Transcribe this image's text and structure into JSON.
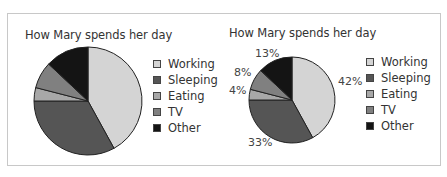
{
  "chart_data": [
    {
      "type": "pie",
      "title": "How Mary spends her day",
      "categories": [
        "Working",
        "Sleeping",
        "Eating",
        "TV",
        "Other"
      ],
      "values": [
        42,
        33,
        4,
        8,
        13
      ],
      "colors": [
        "#d4d4d4",
        "#555555",
        "#a8a8a8",
        "#808080",
        "#141414"
      ],
      "data_labels_shown": false,
      "start_angle": "12 o'clock",
      "direction": "clockwise",
      "legend_position": "right"
    },
    {
      "type": "pie",
      "title": "How Mary spends her day",
      "categories": [
        "Working",
        "Sleeping",
        "Eating",
        "TV",
        "Other"
      ],
      "values": [
        42,
        33,
        4,
        8,
        13
      ],
      "colors": [
        "#d4d4d4",
        "#555555",
        "#a8a8a8",
        "#808080",
        "#141414"
      ],
      "data_labels_shown": true,
      "data_labels": [
        "42%",
        "33%",
        "4%",
        "8%",
        "13%"
      ],
      "start_angle": "12 o'clock",
      "direction": "clockwise",
      "legend_position": "right"
    }
  ],
  "left": {
    "title": "How Mary spends her day",
    "legend": [
      "Working",
      "Sleeping",
      "Eating",
      "TV",
      "Other"
    ]
  },
  "right": {
    "title": "How Mary spends her day",
    "legend": [
      "Working",
      "Sleeping",
      "Eating",
      "TV",
      "Other"
    ],
    "labels": {
      "working": "42%",
      "sleeping": "33%",
      "eating": "4%",
      "tv": "8%",
      "other": "13%"
    }
  }
}
